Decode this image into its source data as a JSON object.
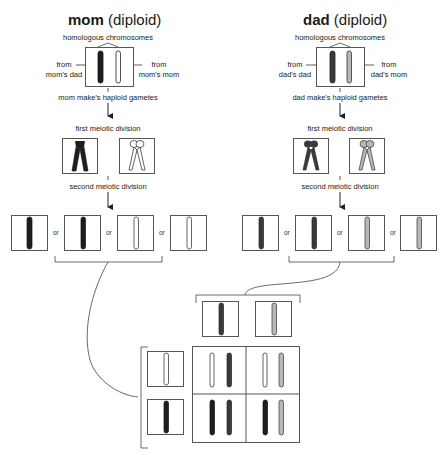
{
  "mom": {
    "title_bold": "mom",
    "title_rest": " (diploid)",
    "homologous_label": "homologous chromosomes",
    "left_source": "from\nmom's dad",
    "right_source": "from\nmom's mom",
    "gametes_label": "mom make's haploid gametes",
    "first_division_label": "first meiotic division",
    "second_division_label": "second meiotic division",
    "chromosome_colors": {
      "paternal": "#1e1e1e",
      "maternal": "#ffffff"
    },
    "gamete_separators": [
      "or",
      "or",
      "or"
    ]
  },
  "dad": {
    "title_bold": "dad",
    "title_rest": " (diploid)",
    "homologous_label": "homologous chromosomes",
    "left_source": "from\ndad's dad",
    "right_source": "from\ndad's mom",
    "gametes_label": "dad make's haploid gametes",
    "first_division_label": "first meiotic division",
    "second_division_label": "second meiotic division",
    "chromosome_colors": {
      "paternal": "#3a3a3a",
      "maternal": "#b8b8b8"
    },
    "gamete_separators": [
      "or",
      "or",
      "or"
    ]
  },
  "punnett": {
    "columns": [
      "dad-paternal (dark gray)",
      "dad-maternal (light gray)"
    ],
    "rows": [
      "mom-maternal (white)",
      "mom-paternal (black)"
    ],
    "cells": [
      [
        "white + dark gray",
        "white + light gray"
      ],
      [
        "black + dark gray",
        "black + light gray"
      ]
    ]
  },
  "colors": {
    "line": "#444444",
    "box_border": "#555555",
    "black_chromosome": "#1e1e1e",
    "dark_gray_chromosome": "#3a3a3a",
    "light_gray_chromosome": "#b8b8b8",
    "white_chromosome": "#ffffff"
  }
}
